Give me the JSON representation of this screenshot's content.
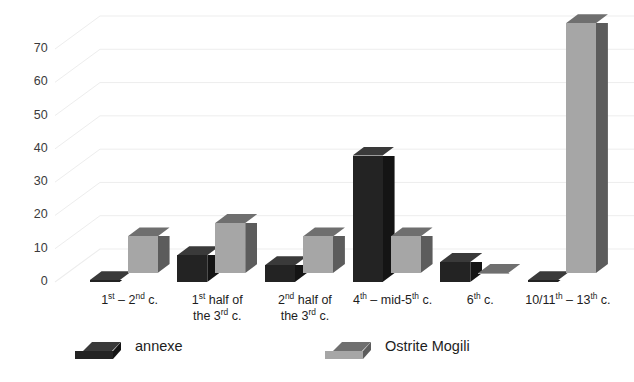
{
  "chart_data": {
    "type": "bar",
    "title": "",
    "subtitle": "",
    "xlabel": "",
    "ylabel": "",
    "style": "3d-clustered-column",
    "grid": true,
    "legend_position": "bottom",
    "ylim": [
      0,
      75
    ],
    "yticks": [
      0,
      10,
      20,
      30,
      40,
      50,
      60,
      70
    ],
    "ytick_labels": [
      "0",
      "10",
      "20",
      "30",
      "40",
      "50",
      "60",
      "70"
    ],
    "categories": [
      "1st – 2nd c.",
      "1st half of\nthe 3rd c.",
      "2nd half of\nthe 3rd c.",
      "4th – mid-5th c.",
      "6th c.",
      "10/11th – 13th c."
    ],
    "categories_rich": [
      [
        {
          "t": "1",
          "sup": "st"
        },
        {
          "t": " – "
        },
        {
          "t": "2",
          "sup": "nd"
        },
        {
          "t": " c."
        }
      ],
      [
        {
          "t": "1",
          "sup": "st"
        },
        {
          "t": " half of"
        },
        {
          "br": true
        },
        {
          "t": "the 3",
          "sup": "rd"
        },
        {
          "t": " c."
        }
      ],
      [
        {
          "t": "2",
          "sup": "nd"
        },
        {
          "t": " half of"
        },
        {
          "br": true
        },
        {
          "t": "the 3",
          "sup": "rd"
        },
        {
          "t": " c."
        }
      ],
      [
        {
          "t": "4",
          "sup": "th"
        },
        {
          "t": " – mid-5",
          "sup": "th"
        },
        {
          "t": " c."
        }
      ],
      [
        {
          "t": "6",
          "sup": "th"
        },
        {
          "t": " c."
        }
      ],
      [
        {
          "t": "10/11",
          "sup": "th"
        },
        {
          "t": " – 13",
          "sup": "th"
        },
        {
          "t": " c."
        }
      ]
    ],
    "series": [
      {
        "name": "annexe",
        "color": "#232323",
        "color_top": "#3a3a3a",
        "color_side": "#141414",
        "values": [
          0.5,
          8,
          5,
          38,
          6,
          0.5
        ]
      },
      {
        "name": "Ostrite Mogili",
        "color": "#a6a6a6",
        "color_top": "#6f6f6f",
        "color_side": "#5c5c5c",
        "values": [
          11,
          15,
          11,
          11,
          0,
          75
        ]
      }
    ]
  },
  "legend": {
    "entries": [
      {
        "label": "annexe",
        "swatch": "dark-3d-swatch"
      },
      {
        "label": "Ostrite Mogili",
        "swatch": "gray-3d-swatch"
      }
    ]
  },
  "colors": {
    "gridline": "#ededed",
    "floor": "#f2f2f2",
    "tick_text": "#3b3b3b",
    "label_text": "#1d1d1d",
    "background": "#ffffff",
    "series_annexe": "#232323",
    "series_ostrite": "#a6a6a6"
  }
}
